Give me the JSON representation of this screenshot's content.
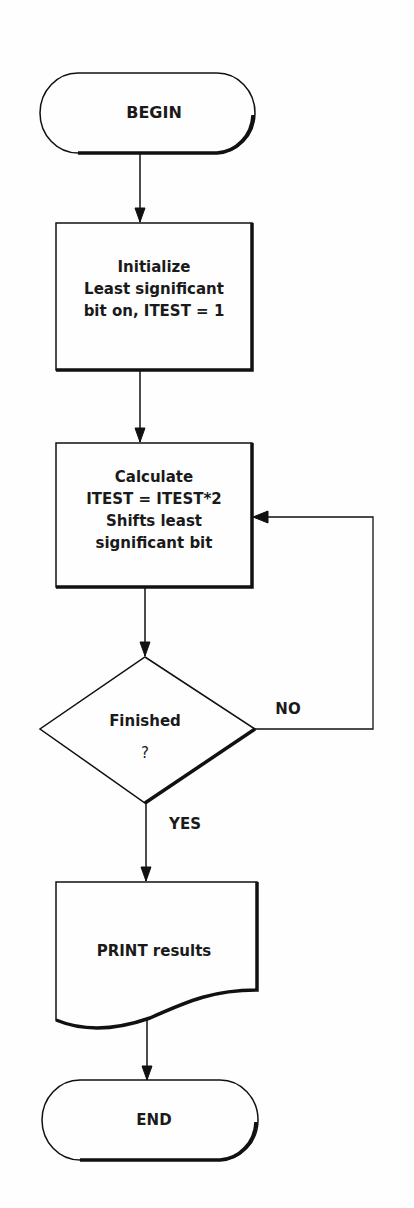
{
  "flowchart": {
    "begin": {
      "label": "BEGIN"
    },
    "initialize": {
      "lines": [
        "Initialize",
        "Least significant",
        "bit on, ITEST = 1"
      ]
    },
    "calculate": {
      "lines": [
        "Calculate",
        "ITEST = ITEST*2",
        "Shifts least",
        "significant bit"
      ]
    },
    "decision": {
      "lines": [
        "Finished",
        "?"
      ],
      "no_label": "NO",
      "yes_label": "YES"
    },
    "print": {
      "label": "PRINT results"
    },
    "end": {
      "label": "END"
    }
  }
}
